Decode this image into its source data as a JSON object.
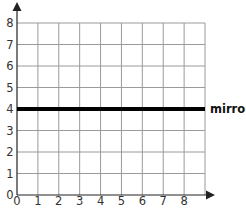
{
  "chart_data": {
    "type": "grid",
    "title": "",
    "xlabel": "",
    "ylabel": "",
    "x_ticks": [
      "0",
      "1",
      "2",
      "3",
      "4",
      "5",
      "6",
      "7",
      "8"
    ],
    "y_ticks": [
      "0",
      "1",
      "2",
      "3",
      "4",
      "5",
      "6",
      "7",
      "8"
    ],
    "xlim": [
      0,
      9
    ],
    "ylim": [
      0,
      8
    ],
    "grid": true,
    "lines": [
      {
        "name": "mirror",
        "type": "horizontal",
        "y": 4,
        "label": "mirror",
        "color": "#000000",
        "width": 4
      }
    ]
  },
  "labels": {
    "mirror": "mirror"
  },
  "colors": {
    "grid": "#9a9a9a",
    "axis": "#222222",
    "mirror": "#000000",
    "text": "#333333"
  }
}
